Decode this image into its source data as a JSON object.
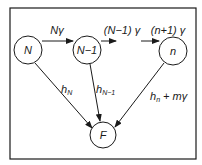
{
  "diagram": {
    "type": "state-transition",
    "frame": {
      "stroke": "#1a1a1a"
    },
    "nodes": [
      {
        "id": "N",
        "label": "N"
      },
      {
        "id": "N-1",
        "label": "N−1"
      },
      {
        "id": "n",
        "label": "n"
      },
      {
        "id": "F",
        "label": "F"
      }
    ],
    "edges": [
      {
        "from": "N",
        "to": "N-1",
        "label": "Nγ"
      },
      {
        "from": "N-1",
        "to": "(gap)",
        "label": "(N−1) γ"
      },
      {
        "from": "(gap)",
        "to": "n",
        "label": "(n+1) γ"
      },
      {
        "from": "N",
        "to": "F",
        "label_main": "h",
        "label_sub": "N"
      },
      {
        "from": "N-1",
        "to": "F",
        "label_main": "h",
        "label_sub": "N−1"
      },
      {
        "from": "n",
        "to": "F",
        "label_main": "h",
        "label_sub": "n",
        "label_suffix": " + mγ"
      }
    ]
  }
}
